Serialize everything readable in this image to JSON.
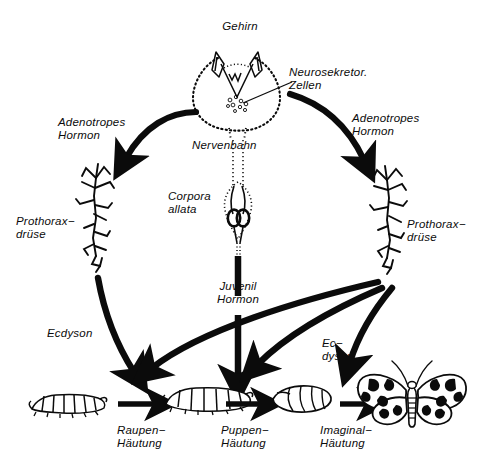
{
  "figure": {
    "language": "German",
    "background_color": "#ffffff",
    "ink_color": "#0b0b0b"
  },
  "labels": {
    "brain": "Gehirn",
    "neurosecretory_cells": "Neurosekretor.\nZellen",
    "adenotropic_hormone_left": "Adenotropes\nHormon",
    "adenotropic_hormone_right": "Adenotropes\nHormon",
    "prothoracic_gland_left": "Prothorax−\ndrüse",
    "prothoracic_gland_right": "Prothorax−\ndrüse",
    "nerve_tract": "Nervenbahn",
    "corpora_allata": "Corpora\nallata",
    "juvenile_hormone": "Juvenil\nHormon",
    "ecdysone_left": "Ecdyson",
    "ecdysone_right": "Ec−\ndyson",
    "larval_moult": "Raupen−\nHäutung",
    "pupal_moult": "Puppen−\nHäutung",
    "imaginal_moult": "Imaginal−\nHäutung"
  },
  "organisms": {
    "larva_small": "caterpillar-small",
    "larva_large": "caterpillar-large",
    "pupa": "pupa-chrysalis",
    "adult": "adult-moth"
  },
  "anatomy": {
    "brain_outline": "stippled-brain-outline",
    "optic_lobes": "optic-lobe-pair",
    "secretory_granules": "neurosecretory-cell-cluster",
    "nerve_cord": "nerve-cord",
    "corpora_allata_body": "corpora-allata-gland",
    "gland_left": "prothoracic-gland-branching-left",
    "gland_right": "prothoracic-gland-branching-right"
  },
  "arrows": {
    "brain_to_gland_left": "adenotropic-hormone-arrow-left",
    "brain_to_gland_right": "adenotropic-hormone-arrow-right",
    "gland_left_to_larval_moult": "ecdysone-arrow-left",
    "gland_right_to_pupal_moult": "ecdysone-arrow-right-pupal",
    "gland_right_to_imaginal_moult": "ecdysone-arrow-right-imaginal",
    "corpora_allata_down": "juvenile-hormone-arrow",
    "larva_to_larva": "larval-moult-arrow",
    "larva_to_pupa": "pupal-moult-arrow",
    "pupa_to_adult": "imaginal-moult-arrow"
  }
}
